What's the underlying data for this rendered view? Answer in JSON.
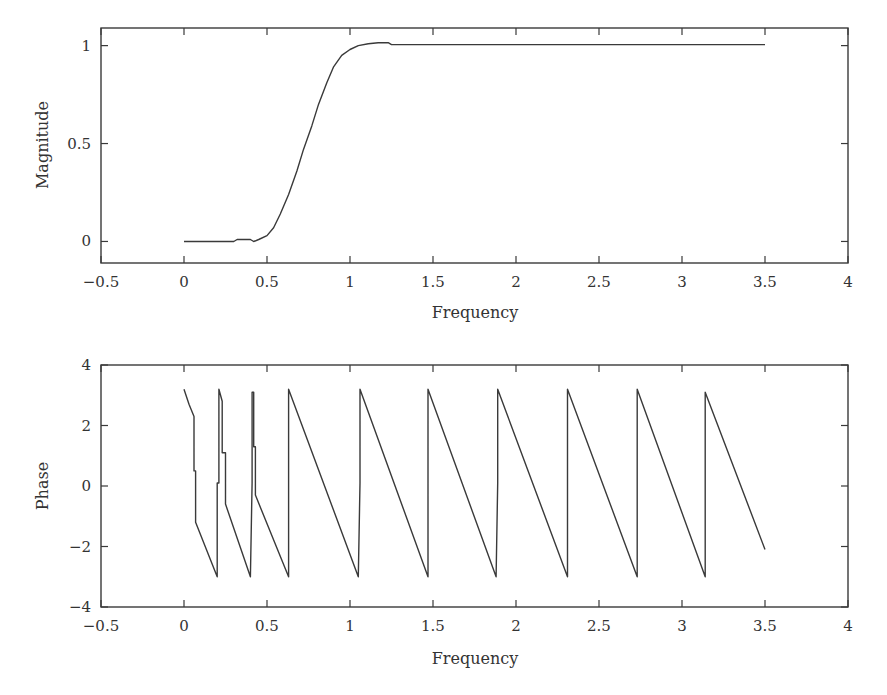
{
  "chart_data": [
    {
      "type": "line",
      "title": "",
      "xlabel": "Frequency",
      "ylabel": "Magnitude",
      "xlim": [
        -0.5,
        4
      ],
      "ylim": [
        -0.11,
        1.09
      ],
      "xticks": [
        -0.5,
        0,
        0.5,
        1,
        1.5,
        2,
        2.5,
        3,
        3.5,
        4
      ],
      "xtick_labels": [
        "−0.5",
        "0",
        "0.5",
        "1",
        "1.5",
        "2",
        "2.5",
        "3",
        "3.5",
        "4"
      ],
      "yticks": [
        0,
        0.5,
        1
      ],
      "ytick_labels": [
        "0",
        "0.5",
        "1"
      ],
      "grid": false,
      "legend": null,
      "series": [
        {
          "name": "Magnitude",
          "x": [
            0,
            0.3,
            0.32,
            0.4,
            0.42,
            0.45,
            0.5,
            0.54,
            0.58,
            0.63,
            0.68,
            0.72,
            0.77,
            0.81,
            0.86,
            0.9,
            0.95,
            1.0,
            1.05,
            1.11,
            1.17,
            1.23,
            1.25,
            1.5,
            2.0,
            2.5,
            3.0,
            3.5
          ],
          "y": [
            0,
            0,
            0.01,
            0.01,
            0,
            0.01,
            0.03,
            0.07,
            0.14,
            0.24,
            0.36,
            0.47,
            0.59,
            0.7,
            0.81,
            0.89,
            0.95,
            0.98,
            1.0,
            1.01,
            1.015,
            1.015,
            1.005,
            1.005,
            1.005,
            1.005,
            1.005,
            1.005
          ]
        }
      ]
    },
    {
      "type": "line",
      "title": "",
      "xlabel": "Frequency",
      "ylabel": "Phase",
      "xlim": [
        -0.5,
        4
      ],
      "ylim": [
        -4,
        4
      ],
      "xticks": [
        -0.5,
        0,
        0.5,
        1,
        1.5,
        2,
        2.5,
        3,
        3.5,
        4
      ],
      "xtick_labels": [
        "−0.5",
        "0",
        "0.5",
        "1",
        "1.5",
        "2",
        "2.5",
        "3",
        "3.5",
        "4"
      ],
      "yticks": [
        -4,
        -2,
        0,
        2,
        4
      ],
      "ytick_labels": [
        "−4",
        "−2",
        "0",
        "2",
        "4"
      ],
      "grid": false,
      "legend": null,
      "series": [
        {
          "name": "Phase",
          "x": [
            0,
            0.03,
            0.06,
            0.06,
            0.07,
            0.07,
            0.2,
            0.2,
            0.21,
            0.21,
            0.23,
            0.23,
            0.25,
            0.25,
            0.4,
            0.41,
            0.41,
            0.42,
            0.42,
            0.43,
            0.43,
            0.63,
            0.63,
            1.05,
            1.06,
            1.06,
            1.47,
            1.47,
            1.88,
            1.89,
            1.89,
            2.31,
            2.31,
            2.73,
            2.73,
            3.14,
            3.14,
            3.5
          ],
          "y": [
            3.2,
            2.7,
            2.3,
            0.5,
            0.5,
            -1.2,
            -3.0,
            0.1,
            0.1,
            3.2,
            2.8,
            1.1,
            1.1,
            -0.6,
            -3.0,
            0.1,
            3.1,
            3.1,
            1.3,
            1.3,
            -0.3,
            -3.0,
            3.2,
            -3.0,
            0.1,
            3.2,
            -3.0,
            3.2,
            -3.0,
            0.1,
            3.2,
            -3.0,
            3.2,
            -3.0,
            3.2,
            -3.0,
            3.1,
            -2.1
          ]
        }
      ]
    }
  ],
  "panels": {
    "top": {
      "xlabel": "Frequency",
      "ylabel": "Magnitude"
    },
    "bottom": {
      "xlabel": "Frequency",
      "ylabel": "Phase"
    }
  }
}
